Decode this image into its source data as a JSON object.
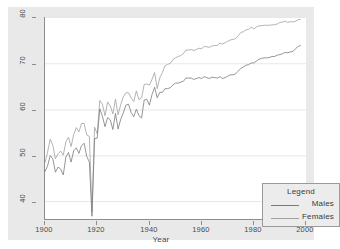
{
  "chart_data": {
    "type": "line",
    "title": "",
    "xlabel": "Year",
    "ylabel": "",
    "xlim": [
      1900,
      2000
    ],
    "ylim": [
      36,
      80
    ],
    "grid": true,
    "grid_axis": "y",
    "legend": {
      "title": "Legend",
      "position": "bottom-right",
      "entries": [
        {
          "name": "Males",
          "color": "#7a7a7a"
        },
        {
          "name": "Females",
          "color": "#a0a0a0"
        }
      ]
    },
    "xticks": [
      1900,
      1920,
      1940,
      1960,
      1980,
      2000
    ],
    "xtick_labels": [
      "1900",
      "1920",
      "1940",
      "1960",
      "1980",
      "2000"
    ],
    "yticks": [
      40,
      50,
      60,
      70,
      80
    ],
    "ytick_labels": [
      "40",
      "50",
      "60",
      "70",
      "80"
    ],
    "x": [
      1900,
      1901,
      1902,
      1903,
      1904,
      1905,
      1906,
      1907,
      1908,
      1909,
      1910,
      1911,
      1912,
      1913,
      1914,
      1915,
      1916,
      1917,
      1918,
      1919,
      1920,
      1921,
      1922,
      1923,
      1924,
      1925,
      1926,
      1927,
      1928,
      1929,
      1930,
      1931,
      1932,
      1933,
      1934,
      1935,
      1936,
      1937,
      1938,
      1939,
      1940,
      1941,
      1942,
      1943,
      1944,
      1945,
      1946,
      1947,
      1948,
      1949,
      1950,
      1951,
      1952,
      1953,
      1954,
      1955,
      1956,
      1957,
      1958,
      1959,
      1960,
      1961,
      1962,
      1963,
      1964,
      1965,
      1966,
      1967,
      1968,
      1969,
      1970,
      1971,
      1972,
      1973,
      1974,
      1975,
      1976,
      1977,
      1978,
      1979,
      1980,
      1981,
      1982,
      1983,
      1984,
      1985,
      1986,
      1987,
      1988,
      1989,
      1990,
      1991,
      1992,
      1993,
      1994,
      1995,
      1996,
      1997,
      1998
    ],
    "series": [
      {
        "name": "Males",
        "color": "#7a7a7a",
        "values": [
          46.3,
          47.6,
          49.8,
          49.1,
          46.2,
          47.3,
          46.9,
          45.6,
          49.5,
          50.5,
          48.4,
          50.9,
          51.5,
          50.3,
          52.0,
          52.5,
          49.6,
          48.4,
          36.6,
          53.5,
          53.6,
          60.0,
          58.4,
          56.1,
          58.1,
          57.6,
          55.5,
          59.0,
          55.6,
          57.7,
          59.1,
          60.8,
          61.0,
          59.2,
          58.3,
          59.9,
          58.5,
          58.0,
          61.9,
          62.1,
          60.8,
          63.1,
          64.7,
          62.4,
          63.6,
          63.6,
          64.4,
          64.4,
          64.6,
          65.2,
          65.6,
          65.6,
          65.8,
          66.0,
          66.7,
          66.7,
          66.7,
          66.4,
          66.6,
          66.8,
          66.6,
          67.0,
          66.8,
          66.6,
          66.9,
          66.8,
          66.7,
          67.0,
          66.6,
          66.8,
          67.1,
          67.4,
          67.4,
          67.6,
          68.2,
          68.8,
          69.1,
          69.5,
          69.6,
          70.0,
          70.0,
          70.4,
          70.8,
          71.0,
          71.1,
          71.1,
          71.2,
          71.4,
          71.4,
          71.7,
          71.8,
          72.0,
          72.3,
          72.2,
          72.4,
          72.5,
          73.1,
          73.6,
          73.8
        ]
      },
      {
        "name": "Females",
        "color": "#a0a0a0",
        "values": [
          48.3,
          50.6,
          53.4,
          52.0,
          49.1,
          50.2,
          50.8,
          49.9,
          52.8,
          53.8,
          51.8,
          54.4,
          55.9,
          55.0,
          56.8,
          56.8,
          54.3,
          54.0,
          37.5,
          56.0,
          54.6,
          61.8,
          61.0,
          58.5,
          61.5,
          60.6,
          58.9,
          62.1,
          58.7,
          60.9,
          62.6,
          63.5,
          63.5,
          62.4,
          61.6,
          63.9,
          62.0,
          62.4,
          65.3,
          65.4,
          65.2,
          66.4,
          67.9,
          64.4,
          66.8,
          67.9,
          69.4,
          69.7,
          69.9,
          70.7,
          71.1,
          71.4,
          71.6,
          72.0,
          72.8,
          72.8,
          72.9,
          72.7,
          72.9,
          73.2,
          73.1,
          73.6,
          73.5,
          73.4,
          73.7,
          73.8,
          73.8,
          74.3,
          74.1,
          74.4,
          74.7,
          75.0,
          75.1,
          75.3,
          75.9,
          76.6,
          76.8,
          77.2,
          77.3,
          77.8,
          77.4,
          77.8,
          78.1,
          78.1,
          78.2,
          78.2,
          78.2,
          78.3,
          78.3,
          78.5,
          78.8,
          78.9,
          79.1,
          78.8,
          79.0,
          78.9,
          79.1,
          79.4,
          79.5
        ]
      }
    ]
  },
  "axes": {
    "x_title": "Year"
  }
}
